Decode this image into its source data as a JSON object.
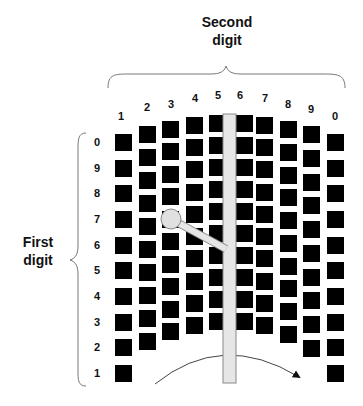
{
  "labels": {
    "second_digit_line1": "Second",
    "second_digit_line2": "digit",
    "first_digit_line1": "First",
    "first_digit_line2": "digit"
  },
  "column_labels": [
    "1",
    "2",
    "3",
    "4",
    "5",
    "6",
    "7",
    "8",
    "9",
    "0"
  ],
  "row_labels": [
    "0",
    "9",
    "8",
    "7",
    "6",
    "5",
    "4",
    "3",
    "2",
    "1"
  ],
  "colors": {
    "square": "#000000",
    "bar_fill": "#e6e6e6",
    "bar_stroke": "#888888",
    "brace": "#777777",
    "arc": "#444444"
  },
  "grid": {
    "columns": [
      {
        "label": "1",
        "x": 115,
        "top": 134,
        "bottom": 365
      },
      {
        "label": "2",
        "x": 139,
        "top": 126,
        "bottom": 333
      },
      {
        "label": "3",
        "x": 162,
        "top": 121,
        "bottom": 323
      },
      {
        "label": "4",
        "x": 186,
        "top": 117,
        "bottom": 317
      },
      {
        "label": "5",
        "x": 209,
        "top": 115,
        "bottom": 313
      },
      {
        "label": "6",
        "x": 236,
        "top": 115,
        "bottom": 313
      },
      {
        "label": "7",
        "x": 256,
        "top": 117,
        "bottom": 317
      },
      {
        "label": "8",
        "x": 280,
        "top": 121,
        "bottom": 326
      },
      {
        "label": "9",
        "x": 303,
        "top": 126,
        "bottom": 340
      },
      {
        "label": "0",
        "x": 327,
        "top": 134,
        "bottom": 365
      }
    ],
    "squares_per_column": 10,
    "square_size": 17
  },
  "selector": {
    "circle_center": [
      171,
      219
    ],
    "circle_radius": 10,
    "selected_column": "3",
    "selected_row": "6"
  }
}
